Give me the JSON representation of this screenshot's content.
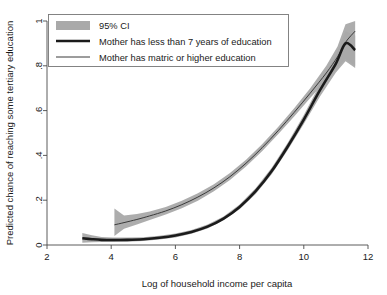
{
  "chart_data": {
    "type": "line",
    "title": "",
    "subtitle": "",
    "xlabel": "Log of household income per capita",
    "ylabel": "Predicted chance of reaching some tertiary education",
    "xlim": [
      2,
      12
    ],
    "ylim": [
      0,
      1
    ],
    "xticks": [
      2,
      4,
      6,
      8,
      10,
      12
    ],
    "xticklabels": [
      "2",
      "4",
      "6",
      "8",
      "10",
      "12"
    ],
    "yticks": [
      0,
      0.2,
      0.4,
      0.6,
      0.8,
      1
    ],
    "yticklabels": [
      "0",
      ".2",
      ".4",
      ".6",
      ".8",
      "1"
    ],
    "grid": false,
    "legend_position": "upper-left-inside",
    "legend_entries": [
      {
        "label": "95% CI",
        "marker": "band",
        "color": "#a9a9a9"
      },
      {
        "label": "Mother has less than 7 years of education",
        "marker": "thick-line",
        "color": "#1b1b1b"
      },
      {
        "label": "Mother has matric or higher education",
        "marker": "thin-line",
        "color": "#3a3a3a"
      }
    ],
    "series": [
      {
        "name": "Mother has less than 7 years of education",
        "style": "thick-line",
        "color": "#1b1b1b",
        "x": [
          3.1,
          3.4,
          3.7,
          4.05,
          4.5,
          5.0,
          5.5,
          6.0,
          6.5,
          7.0,
          7.5,
          8.0,
          8.5,
          9.0,
          9.5,
          10.0,
          10.5,
          11.0,
          11.3,
          11.6
        ],
        "y": [
          0.03,
          0.026,
          0.023,
          0.022,
          0.023,
          0.026,
          0.032,
          0.042,
          0.058,
          0.082,
          0.118,
          0.17,
          0.24,
          0.33,
          0.44,
          0.56,
          0.69,
          0.81,
          0.9,
          0.87
        ],
        "ci_lower": [
          0.01,
          0.012,
          0.013,
          0.013,
          0.015,
          0.018,
          0.024,
          0.034,
          0.05,
          0.074,
          0.11,
          0.16,
          0.228,
          0.316,
          0.424,
          0.54,
          0.662,
          0.77,
          0.82,
          0.79
        ],
        "ci_upper": [
          0.054,
          0.044,
          0.036,
          0.033,
          0.033,
          0.035,
          0.041,
          0.051,
          0.067,
          0.091,
          0.127,
          0.181,
          0.253,
          0.345,
          0.457,
          0.58,
          0.716,
          0.848,
          0.955,
          0.935
        ]
      },
      {
        "name": "Mother has matric or higher education",
        "style": "thin-line",
        "color": "#3a3a3a",
        "x": [
          4.1,
          4.4,
          4.8,
          5.2,
          5.7,
          6.2,
          6.7,
          7.2,
          7.7,
          8.2,
          8.7,
          9.2,
          9.7,
          10.2,
          10.7,
          11.05,
          11.3,
          11.6
        ],
        "y": [
          0.09,
          0.1,
          0.114,
          0.13,
          0.152,
          0.18,
          0.214,
          0.255,
          0.305,
          0.365,
          0.434,
          0.51,
          0.592,
          0.678,
          0.768,
          0.84,
          0.905,
          0.955
        ],
        "ci_lower": [
          0.04,
          0.072,
          0.092,
          0.112,
          0.136,
          0.164,
          0.198,
          0.24,
          0.29,
          0.35,
          0.418,
          0.494,
          0.574,
          0.656,
          0.736,
          0.796,
          0.83,
          0.8
        ],
        "ci_upper": [
          0.163,
          0.132,
          0.138,
          0.15,
          0.17,
          0.197,
          0.231,
          0.271,
          0.321,
          0.381,
          0.45,
          0.527,
          0.611,
          0.7,
          0.8,
          0.886,
          0.985,
          1.0
        ]
      }
    ]
  },
  "axes": {
    "x_label": "Log of household income per capita",
    "y_label": "Predicted chance of reaching some tertiary education",
    "x_ticks": [
      "2",
      "4",
      "6",
      "8",
      "10",
      "12"
    ],
    "y_ticks": [
      "0",
      ".2",
      ".4",
      ".6",
      ".8",
      "1"
    ]
  },
  "legend": {
    "items": [
      {
        "label": "95% CI"
      },
      {
        "label": "Mother has less than 7 years of education"
      },
      {
        "label": "Mother has matric or higher education"
      }
    ]
  },
  "colors": {
    "ci_band": "#a9a9a9",
    "line_low_education": "#1b1b1b",
    "line_high_education": "#3a3a3a",
    "axis": "#4a4a4a",
    "background": "#ffffff"
  }
}
